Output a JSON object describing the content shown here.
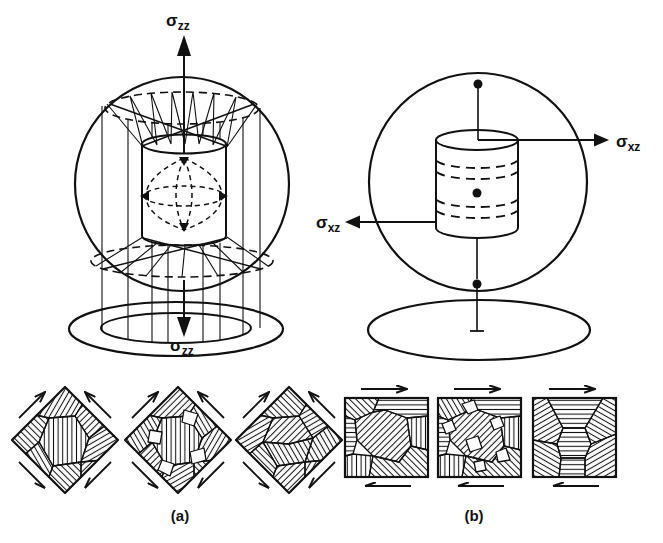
{
  "figure": {
    "type": "scientific-illustration",
    "background_color": "#ffffff",
    "ink_color": "#111111",
    "panel_a": {
      "caption": "(a)",
      "stress_label_top": {
        "symbol": "σ",
        "subscript": "zz"
      },
      "stress_label_bottom": {
        "symbol": "σ",
        "subscript": "zz"
      }
    },
    "panel_b": {
      "caption": "(b)",
      "stress_label_right": {
        "symbol": "σ",
        "subscript": "xz"
      },
      "stress_label_left": {
        "symbol": "σ",
        "subscript": "xz"
      }
    },
    "icons": {
      "sigma_zz_up_arrow": "filled-up-arrow",
      "sigma_zz_down_arrow": "filled-down-arrow",
      "sigma_xz_right_arrow": "filled-right-arrow",
      "sigma_xz_left_arrow": "filled-left-arrow",
      "shear_couple_arrow": "half-barb-shear-arrow"
    }
  }
}
